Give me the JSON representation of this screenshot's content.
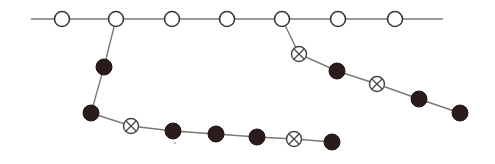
{
  "diagram": {
    "type": "branching-chain",
    "colors": {
      "edge": "#7a7a74",
      "open_stroke": "#3a3a36",
      "filled": "#2b1b1b",
      "crossed_stroke": "#4a4a46",
      "background": "#ffffff"
    },
    "main_line": {
      "x1": 31,
      "y1": 19,
      "x2": 443,
      "y2": 19
    },
    "nodes": [
      {
        "id": "m1",
        "kind": "open",
        "x": 62,
        "y": 19
      },
      {
        "id": "m2",
        "kind": "open",
        "x": 116,
        "y": 19
      },
      {
        "id": "m3",
        "kind": "open",
        "x": 172,
        "y": 19
      },
      {
        "id": "m4",
        "kind": "open",
        "x": 227,
        "y": 19
      },
      {
        "id": "m5",
        "kind": "open",
        "x": 282,
        "y": 19
      },
      {
        "id": "m6",
        "kind": "open",
        "x": 338,
        "y": 19
      },
      {
        "id": "m7",
        "kind": "open",
        "x": 395,
        "y": 19
      },
      {
        "id": "a1",
        "kind": "filled",
        "x": 104,
        "y": 67
      },
      {
        "id": "a2",
        "kind": "filled",
        "x": 91,
        "y": 113
      },
      {
        "id": "a3",
        "kind": "crossed",
        "x": 131,
        "y": 126
      },
      {
        "id": "a4",
        "kind": "filled",
        "x": 173,
        "y": 131
      },
      {
        "id": "a5",
        "kind": "filled",
        "x": 216,
        "y": 134
      },
      {
        "id": "a6",
        "kind": "filled",
        "x": 257,
        "y": 137
      },
      {
        "id": "a7",
        "kind": "crossed",
        "x": 294,
        "y": 139
      },
      {
        "id": "a8",
        "kind": "filled",
        "x": 332,
        "y": 142
      },
      {
        "id": "b1",
        "kind": "crossed",
        "x": 299,
        "y": 54
      },
      {
        "id": "b2",
        "kind": "filled",
        "x": 337,
        "y": 71
      },
      {
        "id": "b3",
        "kind": "crossed",
        "x": 377,
        "y": 84
      },
      {
        "id": "b4",
        "kind": "filled",
        "x": 419,
        "y": 99
      },
      {
        "id": "b5",
        "kind": "filled",
        "x": 460,
        "y": 113
      }
    ],
    "branches": [
      {
        "name": "left-branch",
        "from": "m2",
        "path": [
          "m2",
          "a1",
          "a2",
          "a3",
          "a4",
          "a5",
          "a6",
          "a7",
          "a8"
        ]
      },
      {
        "name": "right-branch",
        "from": "m5",
        "path": [
          "m5",
          "b1",
          "b2",
          "b3",
          "b4",
          "b5"
        ]
      }
    ],
    "legend": {
      "open": "open circle node",
      "filled": "filled black node",
      "crossed": "circle with X node"
    }
  }
}
